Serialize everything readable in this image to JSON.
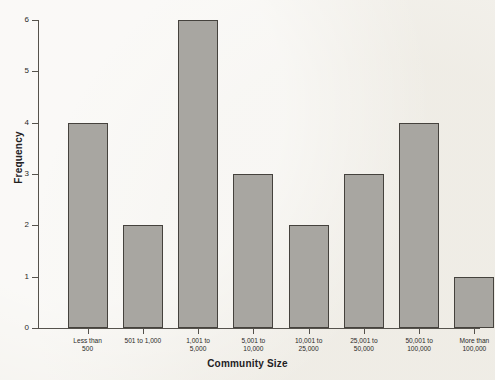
{
  "chart_data": {
    "type": "bar",
    "title": "",
    "xlabel": "Community Size",
    "ylabel": "Frequency",
    "categories": [
      "Less than\n500",
      "501 to 1,000",
      "1,001 to\n5,000",
      "5,001 to\n10,000",
      "10,001 to\n25,000",
      "25,001 to\n50,000",
      "50,001 to\n100,000",
      "More than\n100,000"
    ],
    "category_lines": [
      [
        "Less than",
        "500"
      ],
      [
        "501 to 1,000"
      ],
      [
        "1,001 to",
        "5,000"
      ],
      [
        "5,001 to",
        "10,000"
      ],
      [
        "10,001 to",
        "25,000"
      ],
      [
        "25,001 to",
        "50,000"
      ],
      [
        "50,001 to",
        "100,000"
      ],
      [
        "More than",
        "100,000"
      ]
    ],
    "values": [
      4,
      2,
      6,
      3,
      2,
      3,
      4,
      1
    ],
    "ylim": [
      0,
      6
    ],
    "yticks": [
      0,
      1,
      2,
      3,
      4,
      5,
      6
    ],
    "ytick_labels": [
      "0",
      "1",
      "2",
      "3",
      "4",
      "5",
      "6"
    ],
    "grid": false,
    "legend": null,
    "colors": {
      "bar_fill": "#a8a6a1",
      "bar_border": "#45423d",
      "axis": "#55524c",
      "text": "#22211f",
      "background": "#f4f2ed"
    }
  }
}
